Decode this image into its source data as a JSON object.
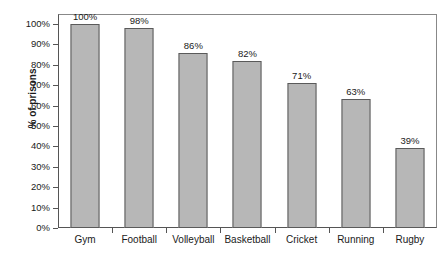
{
  "chart_data": {
    "type": "bar",
    "title": "",
    "xlabel": "",
    "ylabel": "% of prisons",
    "categories": [
      "Gym",
      "Football",
      "Volleyball",
      "Basketball",
      "Cricket",
      "Running",
      "Rugby"
    ],
    "values": [
      100,
      98,
      86,
      82,
      71,
      63,
      39
    ],
    "value_labels": [
      "100%",
      "98%",
      "86%",
      "82%",
      "71%",
      "63%",
      "39%"
    ],
    "ylim": [
      0,
      100
    ],
    "ytick_values": [
      0,
      10,
      20,
      30,
      40,
      50,
      60,
      70,
      80,
      90,
      100
    ],
    "ytick_labels": [
      "0%",
      "10%",
      "20%",
      "30%",
      "40%",
      "50%",
      "60%",
      "70%",
      "80%",
      "90%",
      "100%"
    ],
    "grid": false,
    "legend": false,
    "legend_position": "none",
    "bar_fill_color": "#b7b7b7",
    "bar_border_color": "#5a5a5a",
    "axis_color": "#555555",
    "text_color": "#1a1a1a"
  }
}
